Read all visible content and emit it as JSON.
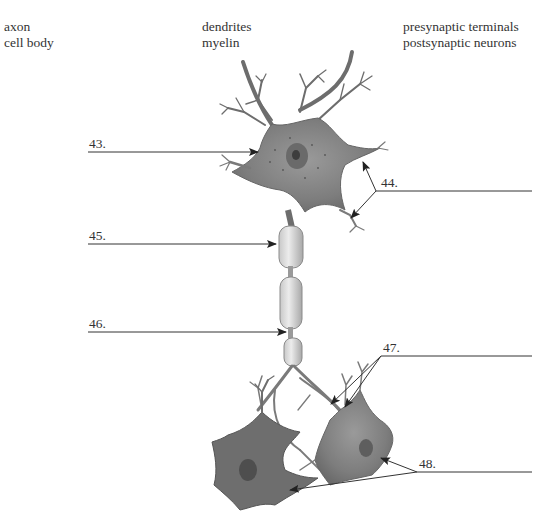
{
  "word_bank": {
    "columns": [
      [
        "axon",
        "cell body"
      ],
      [
        "dendrites",
        "myelin"
      ],
      [
        "presynaptic terminals",
        "postsynaptic neurons"
      ]
    ]
  },
  "labels": [
    {
      "id": "43",
      "text": "43.",
      "target": "cell body"
    },
    {
      "id": "44",
      "text": "44.",
      "target": "dendrites"
    },
    {
      "id": "45",
      "text": "45.",
      "target": "myelin"
    },
    {
      "id": "46",
      "text": "46.",
      "target": "axon"
    },
    {
      "id": "47",
      "text": "47.",
      "target": "presynaptic terminals"
    },
    {
      "id": "48",
      "text": "48.",
      "target": "postsynaptic neurons"
    }
  ],
  "colors": {
    "neuron_fill": "#8a8a8a",
    "neuron_dark": "#5a5a5a",
    "myelin_fill": "#d4d4d4",
    "line": "#333333"
  }
}
